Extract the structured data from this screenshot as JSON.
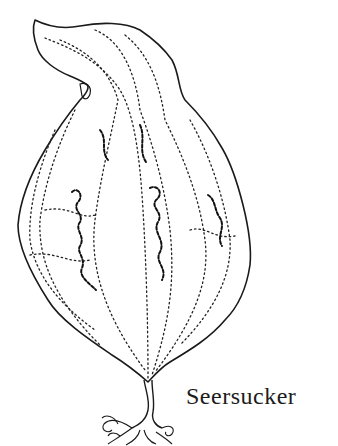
{
  "illustration": {
    "subject": "seaweed-blade-drawing",
    "caption": "Seersucker",
    "colors": {
      "background": "#ffffff",
      "ink": "#1a1a1a"
    }
  }
}
